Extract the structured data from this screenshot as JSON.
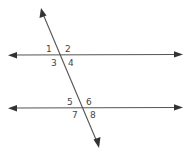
{
  "diagram": {
    "lines": [
      {
        "id": "parallel-top",
        "type": "line",
        "arrows": "both"
      },
      {
        "id": "parallel-bottom",
        "type": "line",
        "arrows": "both"
      },
      {
        "id": "transversal",
        "type": "line",
        "arrows": "both"
      }
    ],
    "intersections": [
      {
        "id": "top",
        "angles": [
          "1",
          "2",
          "3",
          "4"
        ]
      },
      {
        "id": "bottom",
        "angles": [
          "5",
          "6",
          "7",
          "8"
        ]
      }
    ],
    "colors": {
      "line": "#555555",
      "label": "#444444",
      "background": "#ffffff"
    }
  }
}
